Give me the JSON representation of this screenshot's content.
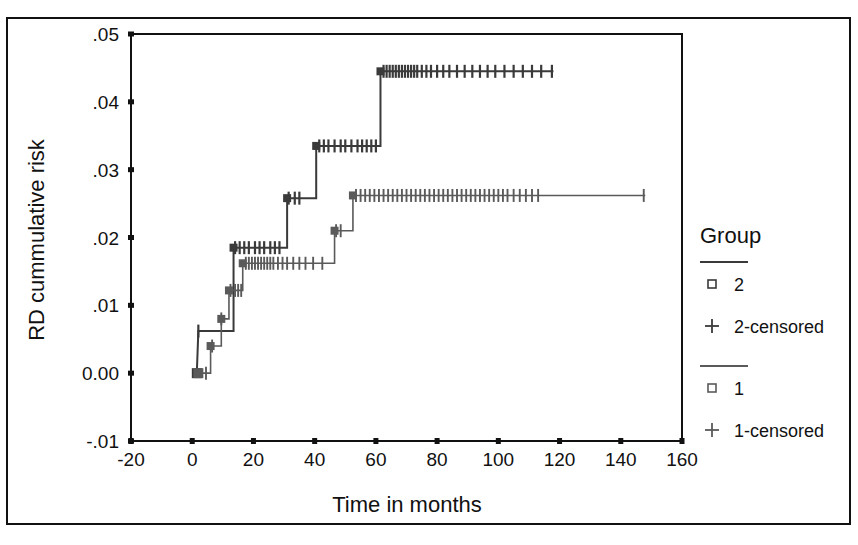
{
  "chart_data": {
    "type": "line",
    "title": "",
    "subtitle": "",
    "xlabel": "Time in months",
    "ylabel": "RD cummulative risk",
    "xlim": [
      -20,
      160
    ],
    "ylim": [
      -0.01,
      0.05
    ],
    "xticks": [
      "-20",
      "0",
      "20",
      "40",
      "60",
      "80",
      "100",
      "120",
      "140",
      "160"
    ],
    "xtick_values": [
      -20,
      0,
      20,
      40,
      60,
      80,
      100,
      120,
      140,
      160
    ],
    "yticks": [
      ".05",
      ".04",
      ".03",
      ".02",
      ".01",
      "0.00",
      "-.01"
    ],
    "ytick_values": [
      0.05,
      0.04,
      0.03,
      0.02,
      0.01,
      0.0,
      -0.01
    ],
    "grid": false,
    "legend_position": "right",
    "plot_style": "kaplan-meier-cumulative-incidence",
    "series": [
      {
        "name": "2",
        "color": "#3a3a3a",
        "steps": [
          {
            "t": 1.5,
            "y": 0.0
          },
          {
            "t": 2.0,
            "y": 0.0062
          },
          {
            "t": 13.5,
            "y": 0.0062
          },
          {
            "t": 13.5,
            "y": 0.0185
          },
          {
            "t": 31.0,
            "y": 0.0185
          },
          {
            "t": 31.0,
            "y": 0.0258
          },
          {
            "t": 40.5,
            "y": 0.0258
          },
          {
            "t": 40.5,
            "y": 0.0335
          },
          {
            "t": 61.5,
            "y": 0.0335
          },
          {
            "t": 61.5,
            "y": 0.0445
          },
          {
            "t": 118.0,
            "y": 0.0445
          }
        ],
        "censored_marks_t": [
          2.0,
          14.0,
          15.5,
          17.0,
          18.5,
          20.5,
          22.0,
          23.5,
          25.5,
          27.0,
          28.5,
          31.5,
          33.5,
          35.0,
          41.5,
          43.0,
          44.5,
          46.5,
          48.5,
          50.0,
          52.0,
          54.0,
          55.5,
          57.0,
          58.5,
          60.0,
          62.5,
          63.5,
          64.5,
          65.5,
          66.5,
          67.5,
          68.5,
          69.5,
          70.5,
          71.5,
          72.5,
          73.5,
          75.0,
          76.5,
          78.0,
          80.0,
          82.0,
          84.0,
          86.5,
          89.0,
          91.5,
          94.0,
          96.5,
          99.0,
          102.0,
          105.0,
          108.0,
          111.0,
          114.0,
          117.5
        ]
      },
      {
        "name": "1",
        "color": "#5a5a5a",
        "steps": [
          {
            "t": 2.0,
            "y": 0.0
          },
          {
            "t": 6.0,
            "y": 0.0
          },
          {
            "t": 6.0,
            "y": 0.004
          },
          {
            "t": 9.5,
            "y": 0.004
          },
          {
            "t": 9.5,
            "y": 0.008
          },
          {
            "t": 12.0,
            "y": 0.008
          },
          {
            "t": 12.0,
            "y": 0.0122
          },
          {
            "t": 16.5,
            "y": 0.0122
          },
          {
            "t": 16.5,
            "y": 0.0162
          },
          {
            "t": 46.5,
            "y": 0.0162
          },
          {
            "t": 46.5,
            "y": 0.021
          },
          {
            "t": 52.5,
            "y": 0.021
          },
          {
            "t": 52.5,
            "y": 0.0262
          },
          {
            "t": 148.0,
            "y": 0.0262
          }
        ],
        "censored_marks_t": [
          4.5,
          6.5,
          9.5,
          12.5,
          14.0,
          15.0,
          16.0,
          17.5,
          18.5,
          19.5,
          20.5,
          21.5,
          22.5,
          23.5,
          24.5,
          25.5,
          26.5,
          28.0,
          29.5,
          31.0,
          33.0,
          35.0,
          37.0,
          39.5,
          42.5,
          47.0,
          48.5,
          53.5,
          55.0,
          56.5,
          58.0,
          59.5,
          61.0,
          62.5,
          64.0,
          65.5,
          67.0,
          68.5,
          70.0,
          71.5,
          73.0,
          74.5,
          76.0,
          77.5,
          79.0,
          80.5,
          82.0,
          83.5,
          85.0,
          86.5,
          88.0,
          89.5,
          91.0,
          92.5,
          94.0,
          95.5,
          97.0,
          98.5,
          100.0,
          101.5,
          103.0,
          105.0,
          107.0,
          109.0,
          111.0,
          113.0,
          147.5
        ]
      }
    ]
  },
  "legend": {
    "title": "Group",
    "entries": [
      {
        "marker": "line",
        "label": ""
      },
      {
        "marker": "square",
        "label": "2"
      },
      {
        "marker": "plus",
        "label": "2-censored"
      },
      {
        "marker": "line",
        "label": ""
      },
      {
        "marker": "square",
        "label": "1"
      },
      {
        "marker": "plus",
        "label": "1-censored"
      }
    ]
  },
  "colors": {
    "axis": "#111111",
    "series_2": "#3a3a3a",
    "series_1": "#5a5a5a",
    "background": "#ffffff",
    "frame": "#111111"
  }
}
